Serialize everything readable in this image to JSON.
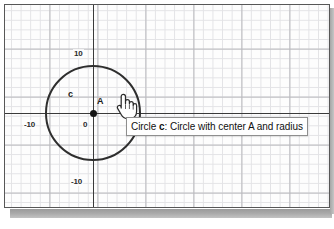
{
  "app": {
    "view_name": "Graphics View"
  },
  "graph": {
    "axes": {
      "x_label_negative": "-10",
      "y_label_positive": "10",
      "y_label_negative": "-10",
      "origin_label": "0",
      "axis_color": "#3a3a3a",
      "grid_minor_color": "#e3e3e6",
      "grid_major_color": "#b9b9bd",
      "grid_visible": true
    },
    "objects": [
      {
        "type": "circle",
        "name": "c",
        "label": "c",
        "center_name": "A",
        "center_label": "A",
        "center_x": 0,
        "center_y": 0,
        "radius": 5,
        "stroke_color": "#2e2e2e"
      },
      {
        "type": "point",
        "name": "A",
        "label": "A",
        "x": 0,
        "y": 0,
        "color": "#141414"
      }
    ]
  },
  "tooltip": {
    "prefix": "Circle ",
    "object_name": "c",
    "description": ": Circle with center A and radius",
    "full_text": "Circle c: Circle with center A and radius",
    "border_color": "#8e8e8e",
    "background_color": "#fefefe"
  },
  "cursor": {
    "icon": "hand-pointer-icon",
    "state": "hovering"
  }
}
